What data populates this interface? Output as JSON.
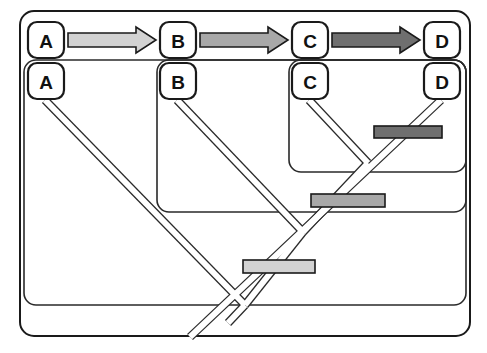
{
  "figure": {
    "type": "nested-cladogram-diagram",
    "caption": "",
    "background_color": "#ffffff",
    "line_color": "#1a1a1a"
  },
  "outer_frame": {
    "name": "outer-rounded-frame",
    "x": 20,
    "y": 11,
    "width": 450,
    "height": 325,
    "radius": 14,
    "stroke": "#1a1a1a",
    "stroke_width": 2,
    "fill": "#ffffff"
  },
  "sequence_row": {
    "name": "transformation-series-row",
    "nodes": [
      {
        "label": "A",
        "x": 28,
        "y": 22,
        "w": 36,
        "h": 36
      },
      {
        "label": "B",
        "x": 160,
        "y": 22,
        "w": 36,
        "h": 36
      },
      {
        "label": "C",
        "x": 292,
        "y": 22,
        "w": 36,
        "h": 36
      },
      {
        "label": "D",
        "x": 424,
        "y": 22,
        "w": 36,
        "h": 36
      }
    ],
    "arrows": [
      {
        "name": "arrow-a-to-b",
        "from": "A",
        "to": "B",
        "x1": 68,
        "x2": 156,
        "y": 40,
        "fill": "#d2d2d2"
      },
      {
        "name": "arrow-b-to-c",
        "from": "B",
        "to": "C",
        "x1": 200,
        "x2": 288,
        "y": 40,
        "fill": "#a8a8a8"
      },
      {
        "name": "arrow-c-to-d",
        "from": "C",
        "to": "D",
        "x1": 332,
        "x2": 420,
        "y": 40,
        "fill": "#6f6f6f"
      }
    ]
  },
  "nested_boxes": [
    {
      "name": "nested-box-a",
      "level": 1,
      "x": 24,
      "y": 60,
      "width": 442,
      "height": 245,
      "radius": 12
    },
    {
      "name": "nested-box-b",
      "level": 2,
      "x": 157,
      "y": 60,
      "width": 309,
      "height": 152,
      "radius": 12
    },
    {
      "name": "nested-box-c",
      "level": 3,
      "x": 289,
      "y": 60,
      "width": 177,
      "height": 112,
      "radius": 12
    }
  ],
  "tree_nodes": [
    {
      "label": "A",
      "x": 28,
      "y": 63,
      "w": 36,
      "h": 36
    },
    {
      "label": "B",
      "x": 160,
      "y": 63,
      "w": 36,
      "h": 36
    },
    {
      "label": "C",
      "x": 292,
      "y": 63,
      "w": 36,
      "h": 36
    },
    {
      "label": "D",
      "x": 424,
      "y": 63,
      "w": 36,
      "h": 36
    }
  ],
  "tree_branches": [
    {
      "name": "branch-tip-a",
      "x1": 45,
      "y1": 100,
      "x2": 245,
      "y2": 305
    },
    {
      "name": "branch-tip-b",
      "x1": 177,
      "y1": 100,
      "x2": 303,
      "y2": 232
    },
    {
      "name": "branch-tip-c",
      "x1": 309,
      "y1": 100,
      "x2": 368,
      "y2": 163
    },
    {
      "name": "branch-tip-d",
      "x1": 441,
      "y1": 100,
      "x2": 190,
      "y2": 337
    },
    {
      "name": "branch-internal-cd",
      "x1": 368,
      "y1": 163,
      "x2": 303,
      "y2": 232
    },
    {
      "name": "branch-internal-bcd",
      "x1": 303,
      "y1": 232,
      "x2": 245,
      "y2": 305
    },
    {
      "name": "branch-root",
      "x1": 245,
      "y1": 305,
      "x2": 228,
      "y2": 323
    }
  ],
  "character_bars": [
    {
      "name": "character-bar-cd",
      "label": "",
      "x": 374,
      "y": 126,
      "width": 68,
      "height": 12,
      "fill": "#6f6f6f",
      "state": "D"
    },
    {
      "name": "character-bar-bcd",
      "label": "",
      "x": 311,
      "y": 194,
      "width": 74,
      "height": 13,
      "fill": "#a8a8a8",
      "state": "C"
    },
    {
      "name": "character-bar-abcd",
      "label": "",
      "x": 243,
      "y": 260,
      "width": 72,
      "height": 13,
      "fill": "#d2d2d2",
      "state": "B"
    }
  ]
}
